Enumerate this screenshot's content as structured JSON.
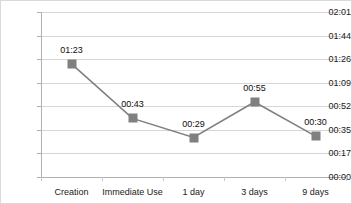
{
  "chart_data": {
    "type": "line",
    "title": "",
    "xlabel": "",
    "ylabel": "",
    "categories": [
      "Creation",
      "Immediate Use",
      "1 day",
      "3 days",
      "9 days"
    ],
    "values": [
      "01:23",
      "00:43",
      "00:29",
      "00:55",
      "00:30"
    ],
    "values_seconds": [
      83,
      43,
      29,
      55,
      30
    ],
    "data_labels": [
      "01:23",
      "00:43",
      "00:29",
      "00:55",
      "00:30"
    ],
    "y_tick_labels": [
      "02:01",
      "01:44",
      "01:26",
      "01:09",
      "00:52",
      "00:35",
      "00:17",
      "00:00"
    ],
    "y_tick_seconds": [
      121,
      104,
      86,
      69,
      52,
      35,
      17,
      0
    ],
    "ylim_seconds": [
      0,
      121
    ],
    "grid": true,
    "legend": false,
    "legend_position": "none",
    "series": [
      {
        "name": "series-1",
        "values": [
          "01:23",
          "00:43",
          "00:29",
          "00:55",
          "00:30"
        ],
        "marker_color": "#808080",
        "line_color": "#808080"
      }
    ],
    "colors": {
      "marker": "#808080",
      "line": "#808080",
      "gridline": "#d6d6d6",
      "axis": "#b0b0b0",
      "text": "#1a1a1a",
      "background": "#ffffff",
      "border": "#d9d9d9"
    }
  }
}
